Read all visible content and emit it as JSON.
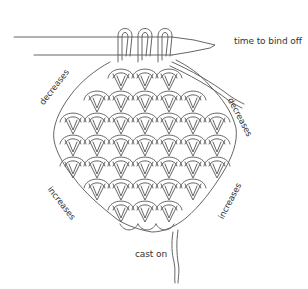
{
  "diagram": {
    "labels": {
      "top_right": "time to bind off",
      "upper_left": "decreases",
      "upper_right": "decreases",
      "lower_left": "increases",
      "lower_right": "increases",
      "bottom": "cast on"
    },
    "stitches_on_needle": 3,
    "rows": [
      3,
      5,
      7,
      7,
      7,
      5,
      3
    ],
    "colors": {
      "line": "#555555",
      "text": "#333333",
      "background": "#ffffff"
    }
  }
}
